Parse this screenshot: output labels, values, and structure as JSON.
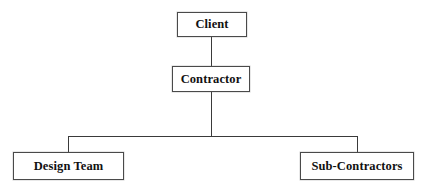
{
  "diagram": {
    "type": "organisation-hierarchy-chart",
    "title": "",
    "background_color": "#ffffff",
    "line_color": "#3a3a3a",
    "box_border_color": "#4a4a4a",
    "box_fill_color": "#ffffff",
    "text_color": "#111111",
    "nodes": [
      {
        "id": "client",
        "label": "Client",
        "level": 0
      },
      {
        "id": "contractor",
        "label": "Contractor",
        "level": 1
      },
      {
        "id": "design-team",
        "label": "Design Team",
        "level": 2
      },
      {
        "id": "sub-contractors",
        "label": "Sub-Contractors",
        "level": 2
      }
    ],
    "edges": [
      {
        "from": "client",
        "to": "contractor",
        "style": "straight-vertical"
      },
      {
        "from": "contractor",
        "to": "design-team",
        "style": "elbow"
      },
      {
        "from": "contractor",
        "to": "sub-contractors",
        "style": "elbow"
      }
    ]
  }
}
